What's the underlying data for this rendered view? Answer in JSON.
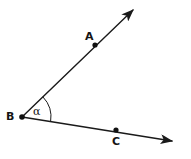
{
  "figure": {
    "type": "geometry-angle-diagram",
    "background_color": "#ffffff",
    "stroke_color": "#1a1a1a",
    "labels": {
      "point_a": "A",
      "point_b": "B",
      "point_c": "C",
      "angle": "α"
    },
    "points": [
      {
        "name": "A",
        "label": "A",
        "x": 95,
        "y": 45
      },
      {
        "name": "B",
        "label": "B",
        "x": 22,
        "y": 117
      },
      {
        "name": "C",
        "label": "C",
        "x": 116,
        "y": 130
      }
    ],
    "rays": [
      {
        "name": "ray-BA",
        "from": "B",
        "through": "A",
        "start": {
          "x": 22,
          "y": 117
        },
        "end": {
          "x": 137,
          "y": 6
        },
        "arrow_at_end": true
      },
      {
        "name": "ray-BC",
        "from": "B",
        "through": "C",
        "start": {
          "x": 22,
          "y": 117
        },
        "end": {
          "x": 178,
          "y": 142
        },
        "arrow_at_end": true
      }
    ],
    "arc": {
      "name": "angle-arc",
      "center": {
        "x": 22,
        "y": 117
      },
      "radius": 29,
      "start_angle_deg": -44,
      "end_angle_deg": 9
    }
  }
}
